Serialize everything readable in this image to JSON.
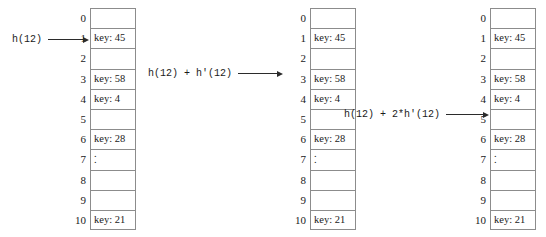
{
  "diagram": {
    "row_indices": [
      "0",
      "1",
      "2",
      "3",
      "4",
      "5",
      "6",
      "7",
      "8",
      "9",
      "10"
    ],
    "dots_marker": ".",
    "tables": [
      {
        "name": "table-probe-1",
        "cells": [
          "",
          "key: 45",
          "",
          "key: 58",
          "key: 4",
          "",
          "key: 28",
          "dots",
          "",
          "",
          "key: 21"
        ]
      },
      {
        "name": "table-probe-2",
        "cells": [
          "",
          "key: 45",
          "",
          "key: 58",
          "key: 4",
          "",
          "key: 28",
          "dots",
          "",
          "",
          "key: 21"
        ]
      },
      {
        "name": "table-probe-3",
        "cells": [
          "",
          "key: 45",
          "",
          "key: 58",
          "key: 4",
          "",
          "key: 28",
          "dots",
          "",
          "",
          "key: 21"
        ]
      }
    ],
    "annotations": [
      {
        "name": "probe-1-label",
        "text": "h(12)",
        "target_index": "1"
      },
      {
        "name": "probe-2-label",
        "text": "h(12) + h'(12)",
        "target_index": "3"
      },
      {
        "name": "probe-3-label",
        "text": "h(12) + 2*h'(12)",
        "target_index": "5"
      }
    ],
    "colors": {
      "background": "#ffffff",
      "cell_border": "#8c8c8c",
      "text": "#1a1a1a",
      "arrow": "#2b2b2b"
    }
  }
}
